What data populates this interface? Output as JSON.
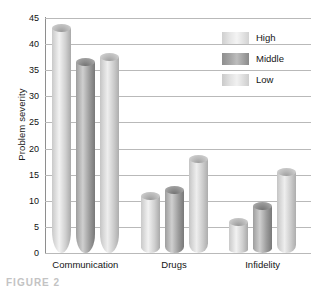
{
  "chart_data": {
    "type": "bar",
    "title": "",
    "xlabel": "",
    "ylabel": "Problem severity",
    "categories": [
      "Communication",
      "Drugs",
      "Infidelity"
    ],
    "series": [
      {
        "name": "High",
        "values": [
          43,
          11,
          6
        ]
      },
      {
        "name": "Middle",
        "values": [
          36.5,
          12,
          9
        ]
      },
      {
        "name": "Low",
        "values": [
          37.5,
          18,
          15.5
        ]
      }
    ],
    "ylim": [
      0,
      45
    ],
    "ytick_step": 5,
    "yticks": [
      "45",
      "40",
      "35",
      "30",
      "25",
      "20",
      "15",
      "10",
      "5",
      "0"
    ],
    "grid": true,
    "legend_position": "top-right",
    "style": "3d-cylinder-bars",
    "colors": {
      "high": "#dcdcdc",
      "middle": "#9d9d9d",
      "low": "#d8d8d8",
      "gridline": "#b9b9b9",
      "axis": "#8e8e8e",
      "text": "#141414",
      "background": "#ffffff"
    }
  },
  "legend": {
    "entries": [
      {
        "label": "High",
        "series_key": "high"
      },
      {
        "label": "Middle",
        "series_key": "middle"
      },
      {
        "label": "Low",
        "series_key": "low"
      }
    ]
  },
  "caption": {
    "text": "FIGURE 2"
  }
}
